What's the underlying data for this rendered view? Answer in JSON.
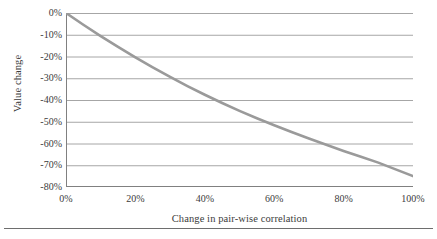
{
  "chart_data": {
    "type": "line",
    "title": "",
    "xlabel": "Change in pair-wise correlation",
    "ylabel": "Value change",
    "xlim": [
      0,
      100
    ],
    "ylim": [
      -80,
      0
    ],
    "grid": true,
    "legend": "none",
    "x_tick_labels": [
      "0%",
      "20%",
      "40%",
      "60%",
      "80%",
      "100%"
    ],
    "x_tick_values": [
      0,
      20,
      40,
      60,
      80,
      100
    ],
    "y_tick_labels": [
      "0%",
      "-10%",
      "-20%",
      "-30%",
      "-40%",
      "-50%",
      "-60%",
      "-70%",
      "-80%"
    ],
    "y_tick_values": [
      0,
      -10,
      -20,
      -30,
      -40,
      -50,
      -60,
      -70,
      -80
    ],
    "series": [
      {
        "name": "Value change",
        "color": "#9a9a9a",
        "x": [
          0,
          5,
          10,
          15,
          20,
          25,
          30,
          35,
          40,
          45,
          50,
          55,
          60,
          65,
          70,
          75,
          80,
          85,
          90,
          95,
          100
        ],
        "values": [
          0,
          -5.4,
          -10.6,
          -15.6,
          -20.4,
          -25.0,
          -29.4,
          -33.6,
          -37.6,
          -41.4,
          -45.0,
          -48.4,
          -51.6,
          -54.7,
          -57.7,
          -60.6,
          -63.4,
          -66.1,
          -68.8,
          -71.9,
          -75.0
        ]
      }
    ]
  },
  "axes": {
    "x_title": "Change in pair-wise correlation",
    "y_title": "Value change"
  },
  "colors": {
    "line": "#9a9a9a",
    "gridline": "#a6a6a6",
    "axis": "#808080",
    "text": "#3b3b3b",
    "rule": "#6e6e6e",
    "background": "#ffffff"
  }
}
